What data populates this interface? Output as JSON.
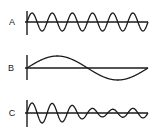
{
  "diagram": {
    "type": "waveform-comparison",
    "colors": {
      "line": "#1a1a1a",
      "background": "#ffffff"
    },
    "waves": [
      {
        "label": "A",
        "description": "high-frequency sine wave, constant amplitude",
        "cycles": 6,
        "amplitude": 9,
        "axis_y": 22,
        "axis_top": 11,
        "axis_bottom": 35,
        "envelope": [
          1,
          1,
          1,
          1,
          1,
          1,
          1
        ]
      },
      {
        "label": "B",
        "description": "low-frequency sine wave, single cycle",
        "cycles": 1,
        "amplitude": 12,
        "axis_y": 68,
        "axis_top": 55,
        "axis_bottom": 80,
        "envelope": [
          1,
          1
        ]
      },
      {
        "label": "C",
        "description": "high-frequency wave with varying amplitude (sum of A and B)",
        "cycles": 6,
        "amplitude": 10,
        "axis_y": 113,
        "axis_top": 100,
        "axis_bottom": 127,
        "envelope": [
          1.0,
          1.0,
          0.85,
          0.5,
          0.35,
          0.45,
          0.5
        ]
      }
    ],
    "axis_x_start": 27,
    "axis_x_end": 148
  }
}
